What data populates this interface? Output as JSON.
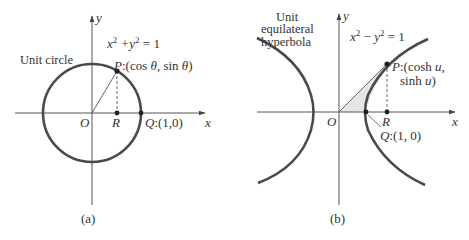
{
  "figure": {
    "panel_a": {
      "caption": "(a)",
      "title": "Unit circle",
      "equation": "x² + y² = 1",
      "axis_x_label": "x",
      "axis_y_label": "y",
      "origin_label": "O",
      "point_r_label": "R",
      "point_q_label": "Q:(1,0)",
      "point_p_label": "P:(cos θ, sin θ)"
    },
    "panel_b": {
      "caption": "(b)",
      "title_lines": [
        "Unit",
        "equilateral",
        "hyperbola"
      ],
      "equation": "x² − y² = 1",
      "axis_x_label": "x",
      "axis_y_label": "y",
      "origin_label": "O",
      "point_r_label": "R",
      "point_q_label": "Q:(1, 0)",
      "point_p_label_line1": "P:(cosh u,",
      "point_p_label_line2": "sinh u)"
    },
    "colors": {
      "curve": "#4a4a4a",
      "axis": "#555555",
      "shade": "#e8e8e8",
      "text": "#333333"
    }
  }
}
